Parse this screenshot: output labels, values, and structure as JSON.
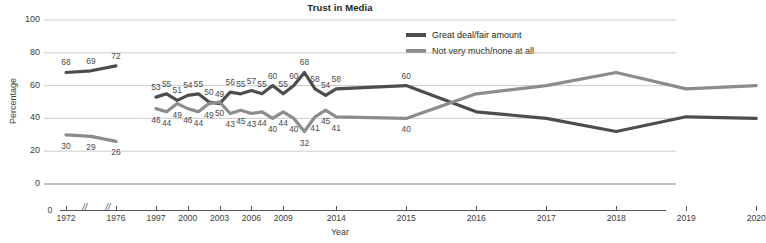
{
  "chart_data": {
    "type": "line",
    "title": "Trust in Media",
    "xlabel": "Year",
    "ylabel": "Percentage",
    "ylim": [
      0,
      100
    ],
    "yticks": [
      0,
      20,
      40,
      60,
      80,
      100
    ],
    "grid": true,
    "axis_break_marker": "//",
    "axis_breaks_after": [
      "1972",
      "1976"
    ],
    "legend_position": "top-right",
    "xtick_labels": [
      "1972",
      "1976",
      "1997",
      "2000",
      "2003",
      "2006",
      "2009",
      "2014",
      "2015",
      "2016",
      "2017",
      "2018",
      "2019",
      "2020"
    ],
    "x": [
      "1972",
      "1974",
      "1976",
      "1997",
      "1998",
      "1999",
      "2000",
      "2001",
      "2002",
      "2003",
      "2004",
      "2005",
      "2006",
      "2007",
      "2008",
      "2009",
      "2010",
      "2011",
      "2012",
      "2013",
      "2014",
      "2015",
      "2016",
      "2017",
      "2018",
      "2019",
      "2020"
    ],
    "series": [
      {
        "name": "Great deal/fair amount",
        "color": "#4d4d4d",
        "values": [
          68,
          69,
          72,
          53,
          55,
          51,
          54,
          55,
          50,
          49,
          56,
          55,
          57,
          55,
          60,
          55,
          60,
          68,
          58,
          54,
          58,
          60,
          44,
          40,
          32,
          41,
          40
        ]
      },
      {
        "name": "Not very much/none at all",
        "color": "#8c8c8c",
        "values": [
          30,
          29,
          26,
          46,
          44,
          49,
          46,
          44,
          49,
          50,
          43,
          45,
          43,
          44,
          40,
          44,
          40,
          32,
          41,
          45,
          41,
          40,
          55,
          60,
          68,
          58,
          60
        ]
      }
    ],
    "dark_line": {
      "name": "Great deal/fair amount",
      "color": "#4d4d4d",
      "points": [
        {
          "x": "1972",
          "y": 68
        },
        {
          "x": "1974",
          "y": 69
        },
        {
          "x": "1976",
          "y": 72
        },
        {
          "x": "1997",
          "y": 53
        },
        {
          "x": "1998",
          "y": 55
        },
        {
          "x": "1999",
          "y": 51
        },
        {
          "x": "2000",
          "y": 54
        },
        {
          "x": "2001",
          "y": 55
        },
        {
          "x": "2002",
          "y": 50
        },
        {
          "x": "2003",
          "y": 49
        },
        {
          "x": "2004",
          "y": 56
        },
        {
          "x": "2005",
          "y": 55
        },
        {
          "x": "2006",
          "y": 57
        },
        {
          "x": "2007",
          "y": 55
        },
        {
          "x": "2008",
          "y": 60
        },
        {
          "x": "2009",
          "y": 55
        },
        {
          "x": "2010",
          "y": 60
        },
        {
          "x": "2011",
          "y": 68
        },
        {
          "x": "2012",
          "y": 58
        },
        {
          "x": "2013",
          "y": 54
        },
        {
          "x": "2014",
          "y": 58
        },
        {
          "x": "2015",
          "y": 60
        }
      ]
    },
    "labels_dark": [
      "68",
      "69",
      "72",
      "53",
      "55",
      "51",
      "54",
      "55",
      "50",
      "49",
      "56",
      "55",
      "57",
      "55",
      "60",
      "55",
      "60",
      "68",
      "58",
      "54",
      "58",
      "60"
    ],
    "labels_light": [
      "30",
      "29",
      "26",
      "46",
      "44",
      "49",
      "46",
      "44",
      "49",
      "50",
      "43",
      "45",
      "43",
      "44",
      "40",
      "44",
      "40",
      "32",
      "41",
      "45",
      "41",
      "40"
    ],
    "annotations": {
      "great_deal": [
        68,
        69,
        72,
        53,
        55,
        51,
        54,
        55,
        50,
        49,
        56,
        55,
        57,
        55,
        60,
        55,
        60,
        68,
        58,
        54,
        58,
        60
      ],
      "not_very_much": [
        30,
        29,
        26,
        46,
        44,
        49,
        46,
        44,
        49,
        50,
        43,
        45,
        43,
        44,
        40,
        44,
        40,
        32,
        41,
        45,
        41,
        40
      ]
    }
  },
  "legend": {
    "items": [
      {
        "label": "Great deal/fair amount",
        "color": "#4d4d4d"
      },
      {
        "label": "Not very much/none at all",
        "color": "#8c8c8c"
      }
    ]
  },
  "colors": {
    "great_deal": "#4d4d4d",
    "not_very_much": "#8c8c8c",
    "grid": "#b8b8b8",
    "axis": "#555555",
    "text": "#3c3c3c"
  }
}
